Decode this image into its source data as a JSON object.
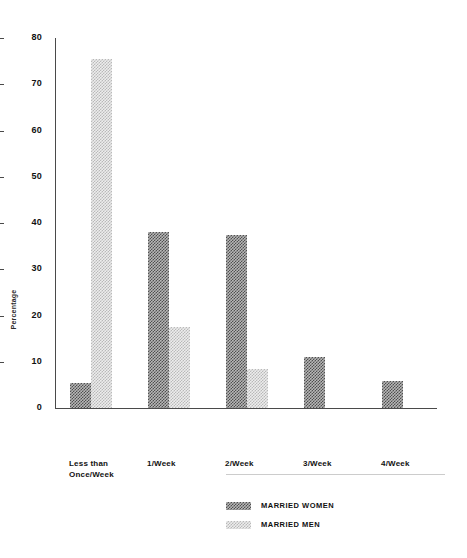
{
  "chart_data": {
    "type": "bar",
    "title": "",
    "subtitle": "",
    "xlabel": "",
    "ylabel": "Percentage",
    "ylim": [
      0,
      80
    ],
    "yticks": [
      0,
      10,
      20,
      30,
      40,
      50,
      60,
      70,
      80
    ],
    "ytick_labels": [
      "0",
      "10",
      "20",
      "30",
      "40",
      "50",
      "60",
      "70",
      "80"
    ],
    "grid": false,
    "legend_position": "bottom-center",
    "categories": [
      "Less than Once/Week",
      "1/Week",
      "2/Week",
      "3/Week",
      "4/Week"
    ],
    "category_lines": [
      [
        "Less than",
        "Once/Week"
      ],
      [
        "1/Week"
      ],
      [
        "2/Week"
      ],
      [
        "3/Week"
      ],
      [
        "4/Week"
      ]
    ],
    "series": [
      {
        "name": "MARRIED WOMEN",
        "color": "#4f4f4f",
        "pattern": "dark-checker",
        "values": [
          5.5,
          38.0,
          37.5,
          11.0,
          5.8
        ]
      },
      {
        "name": "MARRIED MEN",
        "color": "#c9c9c9",
        "pattern": "light-checker",
        "values": [
          75.5,
          17.5,
          8.5,
          0,
          0
        ]
      }
    ]
  },
  "legend": {
    "items": [
      {
        "label": "MARRIED WOMEN",
        "swatch": "dark-checker-swatch"
      },
      {
        "label": "MARRIED MEN",
        "swatch": "light-checker-swatch"
      }
    ]
  },
  "axis": {
    "y_title": "Percentage"
  }
}
